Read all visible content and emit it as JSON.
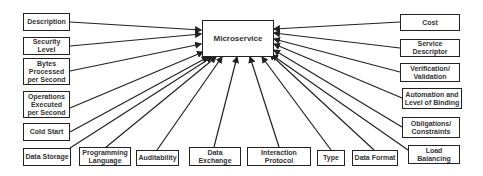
{
  "center": {
    "label": "Microservice"
  },
  "left": [
    {
      "label": "Description"
    },
    {
      "label": "Security Level"
    },
    {
      "label": "Bytes Processed per Second"
    },
    {
      "label": "Operations Executed per Second"
    },
    {
      "label": "Cold Start"
    },
    {
      "label": "Data Storage"
    }
  ],
  "bottom": [
    {
      "label": "Programming Language"
    },
    {
      "label": "Auditability"
    },
    {
      "label": "Data Exchange"
    },
    {
      "label": "Interaction Protocol"
    },
    {
      "label": "Type"
    },
    {
      "label": "Data Format"
    }
  ],
  "right": [
    {
      "label": "Cost"
    },
    {
      "label": "Service Descriptor"
    },
    {
      "label": "Verification/ Validation"
    },
    {
      "label": "Automation and Level of Binding"
    },
    {
      "label": "Obligations/ Constraints"
    },
    {
      "label": "Load Balancing"
    }
  ],
  "colors": {
    "stroke": "#222222",
    "text": "#333333",
    "background": "#ffffff"
  }
}
